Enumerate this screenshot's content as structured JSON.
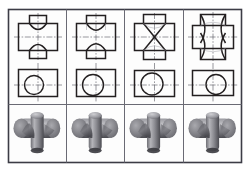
{
  "figure": {
    "frame": {
      "x": 8,
      "y": 9,
      "width": 234,
      "height": 154,
      "stroke": "#3c3c46",
      "fill": "#fdfdfd"
    },
    "grid": {
      "columns": 4,
      "rows": 3,
      "column_divider_color": "#6a6a74",
      "row_divider_color": "#6a6a74"
    },
    "colors": {
      "outline": "#231f20",
      "hidden_line": "#8d8d96",
      "center_line": "#55555e",
      "paper": "#fdfdfd",
      "solid_light": "#b9b9bd",
      "solid_mid": "#8d8d93",
      "solid_dark": "#55555b",
      "solid_shadow": "#3a3a3f"
    },
    "line_types": {
      "visible": "continuous thick",
      "projection": "continuous thin",
      "center": "long dash short dash"
    }
  },
  "columns": [
    {
      "index": 1,
      "case_label": "",
      "front_view": {
        "shape_name": "cross-with-concave-arcs",
        "horizontal_cylinder_diameter": 30,
        "vertical_cylinder_diameter": 22,
        "diameter_ratio": 0.73,
        "intersection_curve": "two shallow concave arcs curving toward the axis crossing"
      },
      "top_view": {
        "shape_name": "rectangle-with-circle",
        "rectangle_width": 52,
        "rectangle_height": 30,
        "circle_diameter": 22,
        "circle_offset_from_center": -6
      },
      "solid_view": {
        "shape_name": "tee-joint-solid",
        "description": "small vertical cylinder meeting large horizontal cylinder"
      }
    },
    {
      "index": 2,
      "case_label": "",
      "front_view": {
        "shape_name": "cross-with-deep-concave-arcs",
        "horizontal_cylinder_diameter": 30,
        "vertical_cylinder_diameter": 26,
        "diameter_ratio": 0.87,
        "intersection_curve": "two deeper concave arcs meeting in sharper V near the axis"
      },
      "top_view": {
        "shape_name": "rectangle-with-circle",
        "rectangle_width": 52,
        "rectangle_height": 30,
        "circle_diameter": 26,
        "circle_offset_from_center": -3
      },
      "solid_view": {
        "shape_name": "tee-joint-solid",
        "description": "near equal cylinders, deep fillet groove"
      }
    },
    {
      "index": 3,
      "case_label": "",
      "front_view": {
        "shape_name": "cross-with-straight-x-crossing",
        "horizontal_cylinder_diameter": 30,
        "vertical_cylinder_diameter": 30,
        "diameter_ratio": 1.0,
        "intersection_curve": "two straight lines forming an X (ellipses degenerate to lines for equal diameters)"
      },
      "top_view": {
        "shape_name": "rectangle-with-circle",
        "rectangle_width": 52,
        "rectangle_height": 30,
        "circle_diameter": 30,
        "circle_offset_from_center": 0
      },
      "solid_view": {
        "shape_name": "cross-joint-solid",
        "description": "equal diameter cylinders crossing, planar intersection"
      }
    },
    {
      "index": 4,
      "case_label": "",
      "front_view": {
        "shape_name": "cross-with-hourglass-curves",
        "horizontal_cylinder_diameter": 26,
        "vertical_cylinder_diameter": 34,
        "diameter_ratio": 1.31,
        "intersection_curve": "two convex curves bulging outward forming an hourglass waist"
      },
      "top_view": {
        "shape_name": "rectangle-with-circle",
        "rectangle_width": 52,
        "rectangle_height": 28,
        "circle_diameter": 24,
        "circle_offset_from_center": 8
      },
      "solid_view": {
        "shape_name": "cross-joint-solid",
        "description": "large vertical cylinder penetrated by smaller horizontal cylinder"
      }
    }
  ]
}
